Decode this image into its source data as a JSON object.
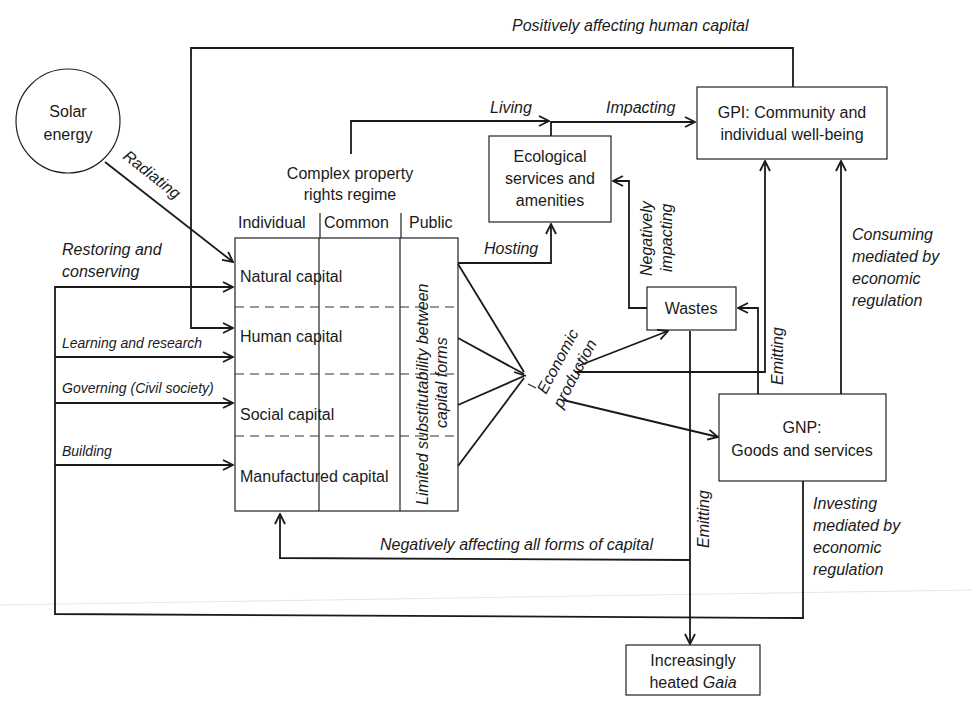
{
  "diagram": {
    "nodes": {
      "solar": {
        "line1": "Solar",
        "line2": "energy"
      },
      "property_regime": {
        "line1": "Complex property",
        "line2": "rights regime"
      },
      "columns": [
        "Individual",
        "Common",
        "Public"
      ],
      "capitals": [
        "Natural capital",
        "Human capital",
        "Social capital",
        "Manufactured capital"
      ],
      "substitutability": {
        "line1": "Limited substitutability between",
        "line2": "capital forms"
      },
      "ecological": {
        "line1": "Ecological",
        "line2": "services and",
        "line3": "amenities"
      },
      "gpi": {
        "line1": "GPI: Community and",
        "line2": "individual well-being"
      },
      "wastes": "Wastes",
      "gnp": {
        "line1": "GNP:",
        "line2": "Goods and services"
      },
      "gaia": {
        "line1": "Increasingly",
        "line2": "heated ",
        "line2_italic": "Gaia"
      },
      "economic_production": {
        "line1": "Economic",
        "line2": "production"
      }
    },
    "edge_labels": {
      "positively_affecting": "Positively affecting human capital",
      "radiating": "Radiating",
      "restoring": {
        "line1": "Restoring and",
        "line2": "conserving"
      },
      "learning": "Learning and research",
      "governing": "Governing (Civil society)",
      "building": "Building",
      "living": "Living",
      "impacting": "Impacting",
      "hosting": "Hosting",
      "negatively_impacting": {
        "line1": "Negatively",
        "line2": "impacting"
      },
      "consuming": {
        "line1": "Consuming",
        "line2": "mediated by",
        "line3": "economic",
        "line4": "regulation"
      },
      "emitting_gnp": "Emitting",
      "emitting_gaia": "Emitting",
      "investing": {
        "line1": "Investing",
        "line2": "mediated by",
        "line3": "economic",
        "line4": "regulation"
      },
      "negatively_affecting_all": "Negatively affecting all forms of capital"
    }
  }
}
